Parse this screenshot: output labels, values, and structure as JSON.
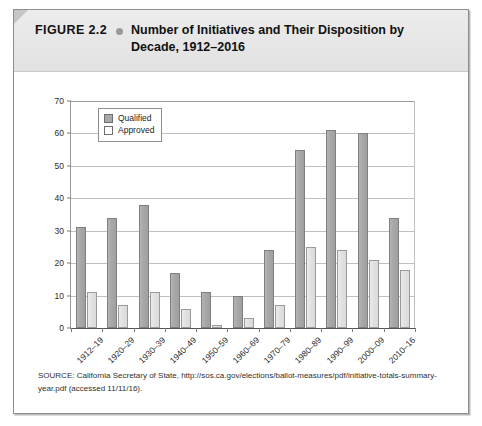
{
  "figure": {
    "label": "FIGURE 2.2",
    "bullet_icon": "bullet-dot-icon",
    "title": "Number of Initiatives and Their Disposition by Decade, 1912–2016",
    "source": "SOURCE: California Secretary of State, http://sos.ca.gov/elections/ballot-measures/pdf/initiative-totals-summary-year.pdf (accessed 11/11/16)."
  },
  "colors": {
    "qualified_fill": "#a8a8a8",
    "approved_fill": "#e4e4e4",
    "bar_border": "#828282",
    "gridline": "#bfbfbf",
    "axis": "#555555",
    "title_band": "#e8e8e8",
    "frame_border": "#8e8e8e"
  },
  "chart_data": {
    "type": "bar",
    "title": "Number of Initiatives and Their Disposition by Decade, 1912–2016",
    "xlabel": "",
    "ylabel": "",
    "categories": [
      "1912–19",
      "1920–29",
      "1930–39",
      "1940–49",
      "1950–59",
      "1960–69",
      "1970–79",
      "1980–89",
      "1990–99",
      "2000–09",
      "2010–16"
    ],
    "series": [
      {
        "name": "Qualified",
        "values": [
          31,
          34,
          38,
          17,
          11,
          10,
          24,
          55,
          61,
          60,
          34
        ]
      },
      {
        "name": "Approved",
        "values": [
          11,
          7,
          11,
          6,
          1,
          3,
          7,
          25,
          24,
          21,
          18
        ]
      }
    ],
    "ylim": [
      0,
      70
    ],
    "yticks": [
      0,
      10,
      20,
      30,
      40,
      50,
      60,
      70
    ],
    "ytick_labels": [
      "0",
      "10",
      "20",
      "30",
      "40",
      "50",
      "60",
      "70"
    ],
    "grid": true,
    "legend_position": "top-left",
    "legend": [
      "Qualified",
      "Approved"
    ]
  }
}
